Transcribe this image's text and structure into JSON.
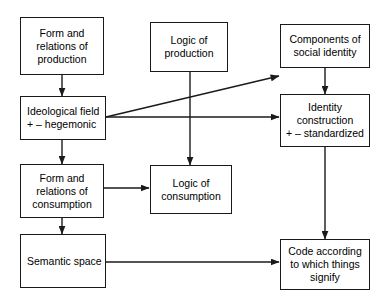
{
  "diagram": {
    "background_color": "#ffffff",
    "line_color": "#1a1a1a",
    "nodes": [
      {
        "id": "form_production",
        "label": "Form and\nrelations of\nproduction"
      },
      {
        "id": "logic_production",
        "label": "Logic of\nproduction"
      },
      {
        "id": "components_identity",
        "label": "Components of\nsocial identity"
      },
      {
        "id": "ideological_field",
        "label": "Ideological field\n+ – hegemonic"
      },
      {
        "id": "identity_construction",
        "label": "Identity\nconstruction\n+ – standardized"
      },
      {
        "id": "form_consumption",
        "label": "Form and\nrelations of\nconsumption"
      },
      {
        "id": "logic_consumption",
        "label": "Logic of\nconsumption"
      },
      {
        "id": "semantic_space",
        "label": "Semantic space"
      },
      {
        "id": "code_signify",
        "label": "Code according\nto which things\nsignify"
      }
    ],
    "edges": [
      {
        "from": "form_production",
        "to": "ideological_field"
      },
      {
        "from": "ideological_field",
        "to": "components_identity"
      },
      {
        "from": "ideological_field",
        "to": "identity_construction"
      },
      {
        "from": "ideological_field",
        "to": "form_consumption"
      },
      {
        "from": "logic_production",
        "to": "logic_consumption"
      },
      {
        "from": "components_identity",
        "to": "identity_construction"
      },
      {
        "from": "form_consumption",
        "to": "logic_consumption"
      },
      {
        "from": "form_consumption",
        "to": "semantic_space"
      },
      {
        "from": "identity_construction",
        "to": "code_signify"
      },
      {
        "from": "semantic_space",
        "to": "code_signify"
      }
    ]
  }
}
